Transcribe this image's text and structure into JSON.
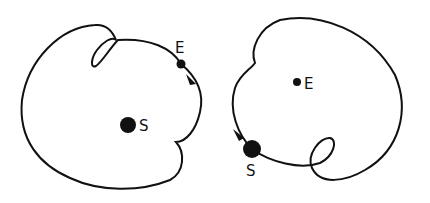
{
  "diagram": {
    "left_panel": {
      "description": "Heliocentric-like view: Earth orbit around Sun with looping path",
      "sun_label": "S",
      "earth_label": "E"
    },
    "right_panel": {
      "description": "Geocentric view: Sun path around Earth with loop",
      "sun_label": "S",
      "earth_label": "E"
    },
    "colors": {
      "stroke": "#111111",
      "background": "#ffffff"
    }
  }
}
